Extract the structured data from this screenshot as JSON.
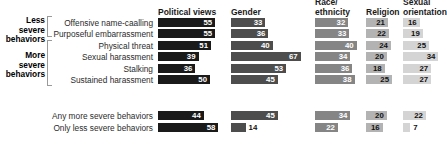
{
  "figure": {
    "background": "#ffffff",
    "width": 444,
    "height": 155
  },
  "severity_groups": [
    {
      "id": "less",
      "line1": "Less",
      "line2": "severe",
      "line3": "behaviors"
    },
    {
      "id": "more",
      "line1": "More",
      "line2": "severe",
      "line3": "behaviors"
    }
  ],
  "columns": [
    {
      "id": "political",
      "head_line1": "",
      "head_line2": "Political views",
      "color": "#1a1a1a"
    },
    {
      "id": "gender",
      "head_line1": "",
      "head_line2": "Gender",
      "color": "#4d4d4d"
    },
    {
      "id": "race",
      "head_line1": "Race/",
      "head_line2": "ethnicity",
      "color": "#858585"
    },
    {
      "id": "religion",
      "head_line1": "",
      "head_line2": "Religion",
      "color": "#b3b3b3"
    },
    {
      "id": "orientation",
      "head_line1": "Sexual",
      "head_line2": "orientation",
      "color": "#d4d4d4"
    }
  ],
  "chart_data": {
    "type": "bar",
    "title": "",
    "xlabel": "",
    "ylabel": "",
    "xlim": [
      0,
      70
    ],
    "grid": false,
    "legend": "none",
    "orientation": "horizontal",
    "categories": [
      "Offensive name-caalling",
      "Purposeful embarrassment",
      "Physical threat",
      "Sexual harassment",
      "Stalking",
      "Sustained harassment"
    ],
    "summary_categories": [
      "Any more severe behaviors",
      "Only less severe behaviors"
    ],
    "series": [
      {
        "name": "Political views",
        "values": [
          55,
          55,
          51,
          39,
          36,
          50
        ],
        "summary_values": [
          44,
          58
        ]
      },
      {
        "name": "Gender",
        "values": [
          33,
          36,
          40,
          67,
          53,
          45
        ],
        "summary_values": [
          45,
          14
        ]
      },
      {
        "name": "Race/ethnicity",
        "values": [
          32,
          33,
          40,
          34,
          36,
          38
        ],
        "summary_values": [
          34,
          22
        ]
      },
      {
        "name": "Religion",
        "values": [
          21,
          22,
          24,
          20,
          18,
          25
        ],
        "summary_values": [
          20,
          16
        ]
      },
      {
        "name": "Sexual orientation",
        "values": [
          16,
          19,
          25,
          34,
          27,
          27
        ],
        "summary_values": [
          22,
          7
        ]
      }
    ]
  }
}
